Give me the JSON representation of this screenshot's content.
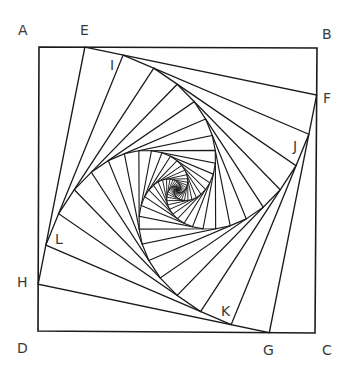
{
  "diagram": {
    "type": "whirling-squares-spiral",
    "outer_square": {
      "A": [
        39,
        47
      ],
      "B": [
        317,
        48
      ],
      "C": [
        315,
        333
      ],
      "D": [
        38,
        331
      ]
    },
    "ratio": 0.165,
    "iterations": 44,
    "stroke_color": "#1a1a1a",
    "labels": [
      {
        "id": "A",
        "text": "A",
        "x": 18,
        "y": 23
      },
      {
        "id": "E",
        "text": "E",
        "x": 80,
        "y": 23
      },
      {
        "id": "B",
        "text": "B",
        "x": 322,
        "y": 27
      },
      {
        "id": "F",
        "text": "F",
        "x": 323,
        "y": 91
      },
      {
        "id": "I",
        "text": "I",
        "x": 110,
        "y": 58
      },
      {
        "id": "J",
        "text": "J",
        "x": 293,
        "y": 139
      },
      {
        "id": "L",
        "text": "L",
        "x": 55,
        "y": 232
      },
      {
        "id": "H",
        "text": "H",
        "x": 17,
        "y": 275
      },
      {
        "id": "K",
        "text": "K",
        "x": 221,
        "y": 304
      },
      {
        "id": "D",
        "text": "D",
        "x": 17,
        "y": 341
      },
      {
        "id": "G",
        "text": "G",
        "x": 263,
        "y": 343
      },
      {
        "id": "C",
        "text": "C",
        "x": 322,
        "y": 343
      }
    ]
  }
}
